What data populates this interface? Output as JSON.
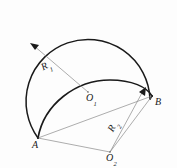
{
  "figure": {
    "type": "geometry-diagram",
    "background_color": "#fdfdfd",
    "stroke_color_heavy": "#1a1a1a",
    "stroke_color_light": "#7a7a7a",
    "labels": {
      "point_a": {
        "text": "A",
        "sub": ""
      },
      "point_b": {
        "text": "B",
        "sub": ""
      },
      "center_o1": {
        "text": "O",
        "sub": "1"
      },
      "center_o2": {
        "text": "O",
        "sub": "2"
      },
      "radius_r1": {
        "text": "R",
        "sub": "1"
      },
      "radius_r2": {
        "text": "R",
        "sub": "2"
      }
    },
    "points": {
      "A": {
        "x": 38,
        "y": 138
      },
      "B": {
        "x": 152,
        "y": 96
      },
      "O1": {
        "x": 88,
        "y": 92
      },
      "O2": {
        "x": 110,
        "y": 152
      },
      "R1_arrow_tip": {
        "x": 31,
        "y": 44
      },
      "R2_arrow_tip": {
        "x": 145,
        "y": 89
      }
    },
    "shapes": {
      "great_circle": {
        "cx": 88,
        "cy": 78,
        "r": 62
      },
      "section_ellipse": {
        "cx": 95,
        "cy": 107,
        "rx": 58,
        "ry": 24,
        "rotation_deg": -20
      }
    }
  }
}
